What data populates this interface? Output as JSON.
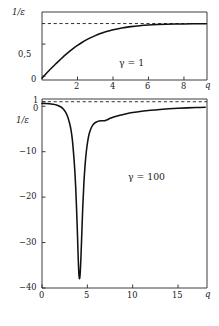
{
  "figure": {
    "panels": [
      {
        "id": "top-panel",
        "annotation": "γ = 1",
        "ylabel": "1/ε",
        "xlabel": "q",
        "ytick_labels": [
          "0,5",
          "0"
        ],
        "xtick_labels": [
          "2",
          "4",
          "6",
          "8"
        ]
      },
      {
        "id": "bottom-panel",
        "annotation": "γ = 100",
        "ylabel": "1/ε",
        "xlabel": "q",
        "ytick_labels": [
          "1",
          "0",
          "−10",
          "−20",
          "−30",
          "−40"
        ],
        "xtick_labels": [
          "0",
          "5",
          "10",
          "15"
        ]
      }
    ]
  },
  "chart_data": [
    {
      "type": "line",
      "id": "top-panel",
      "title": "",
      "xlabel": "q",
      "ylabel": "1/ε",
      "annotation": "γ = 1",
      "xlim": [
        0,
        9.3
      ],
      "ylim": [
        -0.06,
        1.0
      ],
      "xticks": [
        2,
        4,
        6,
        8
      ],
      "yticks": [
        0,
        0.5
      ],
      "grid": false,
      "legend": null,
      "asymptote": {
        "kind": "horizontal-dashed",
        "value": 0.82
      },
      "x": [
        0.0,
        0.25,
        0.5,
        0.75,
        1.0,
        1.25,
        1.5,
        1.75,
        2.0,
        2.25,
        2.5,
        2.75,
        3.0,
        3.25,
        3.5,
        3.75,
        4.0,
        4.5,
        5.0,
        5.5,
        6.0,
        6.5,
        7.0,
        7.5,
        8.0,
        8.5,
        9.0,
        9.25
      ],
      "y": [
        -0.03,
        0.045,
        0.115,
        0.185,
        0.25,
        0.315,
        0.375,
        0.43,
        0.48,
        0.525,
        0.565,
        0.6,
        0.632,
        0.66,
        0.685,
        0.705,
        0.723,
        0.752,
        0.772,
        0.787,
        0.797,
        0.804,
        0.809,
        0.8125,
        0.8145,
        0.816,
        0.8168,
        0.817
      ]
    },
    {
      "type": "line",
      "id": "bottom-panel",
      "title": "",
      "xlabel": "q",
      "ylabel": "1/ε",
      "annotation": "γ = 100",
      "xlim": [
        0,
        18.2
      ],
      "ylim": [
        -40,
        1.6
      ],
      "xticks": [
        0,
        5,
        10,
        15
      ],
      "yticks": [
        1,
        0,
        -10,
        -20,
        -30,
        -40
      ],
      "grid": false,
      "legend": null,
      "asymptote": {
        "kind": "horizontal-dashed",
        "value": 1.0
      },
      "x": [
        0.0,
        0.4,
        0.8,
        1.2,
        1.6,
        2.0,
        2.3,
        2.6,
        2.85,
        3.05,
        3.2,
        3.35,
        3.5,
        3.62,
        3.72,
        3.82,
        3.9,
        3.97,
        4.03,
        4.09,
        4.15,
        4.22,
        4.3,
        4.4,
        4.5,
        4.62,
        4.75,
        4.9,
        5.05,
        5.2,
        5.4,
        5.6,
        5.8,
        6.0,
        6.3,
        6.6,
        6.9,
        7.2,
        7.6,
        8.0,
        8.6,
        9.2,
        10.0,
        11.0,
        12.0,
        13.0,
        14.0,
        15.0,
        16.0,
        17.0,
        18.0
      ],
      "y": [
        0.62,
        0.6,
        0.55,
        0.45,
        0.28,
        -0.05,
        -0.5,
        -1.3,
        -2.4,
        -3.8,
        -5.2,
        -7.4,
        -10.8,
        -14.2,
        -18.0,
        -23.0,
        -27.5,
        -32.0,
        -35.4,
        -37.4,
        -37.9,
        -36.5,
        -33.0,
        -27.5,
        -22.0,
        -17.0,
        -13.0,
        -9.8,
        -7.6,
        -6.1,
        -4.9,
        -4.15,
        -3.7,
        -3.45,
        -3.25,
        -3.2,
        -3.18,
        -2.95,
        -2.6,
        -2.3,
        -1.95,
        -1.68,
        -1.38,
        -1.1,
        -0.88,
        -0.7,
        -0.56,
        -0.44,
        -0.35,
        -0.28,
        -0.22
      ]
    }
  ]
}
